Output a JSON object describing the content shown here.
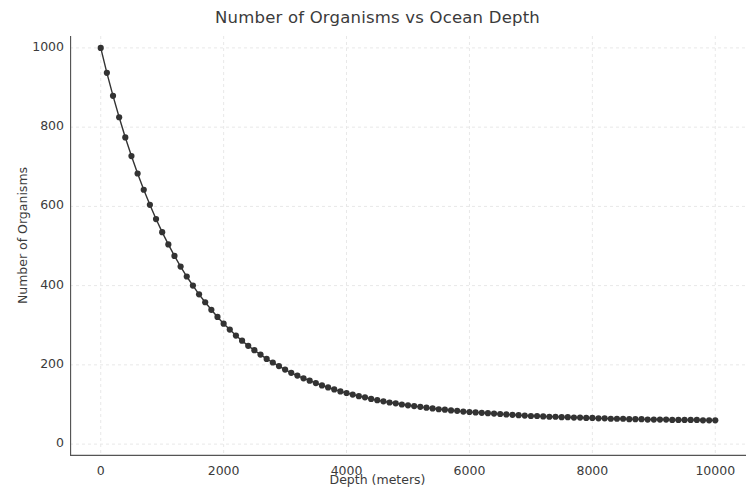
{
  "chart_data": {
    "type": "line",
    "title": "Number of Organisms vs Ocean Depth",
    "xlabel": "Depth (meters)",
    "ylabel": "Number of Organisms",
    "xlim": [
      -500,
      10500
    ],
    "ylim": [
      -30,
      1030
    ],
    "xticks": [
      0,
      2000,
      4000,
      6000,
      8000,
      10000
    ],
    "xtick_labels": [
      "0",
      "2000",
      "4000",
      "6000",
      "8000",
      "10000"
    ],
    "yticks": [
      0,
      200,
      400,
      600,
      800,
      1000
    ],
    "ytick_labels": [
      "0",
      "200",
      "400",
      "600",
      "800",
      "1000"
    ],
    "grid": true,
    "grid_style": "dashed",
    "grid_color": "#e8e8e8",
    "legend": null,
    "marker": "circle",
    "marker_color": "#333333",
    "line_color": "#333333",
    "series": [
      {
        "name": "Number of Organisms",
        "x": [
          0,
          100,
          200,
          300,
          400,
          500,
          600,
          700,
          800,
          900,
          1000,
          1100,
          1200,
          1300,
          1400,
          1500,
          1600,
          1700,
          1800,
          1900,
          2000,
          2100,
          2200,
          2300,
          2400,
          2500,
          2600,
          2700,
          2800,
          2900,
          3000,
          3100,
          3200,
          3300,
          3400,
          3500,
          3600,
          3700,
          3800,
          3900,
          4000,
          4100,
          4200,
          4300,
          4400,
          4500,
          4600,
          4700,
          4800,
          4900,
          5000,
          5100,
          5200,
          5300,
          5400,
          5500,
          5600,
          5700,
          5800,
          5900,
          6000,
          6100,
          6200,
          6300,
          6400,
          6500,
          6600,
          6700,
          6800,
          6900,
          7000,
          7100,
          7200,
          7300,
          7400,
          7500,
          7600,
          7700,
          7800,
          7900,
          8000,
          8100,
          8200,
          8300,
          8400,
          8500,
          8600,
          8700,
          8800,
          8900,
          9000,
          9100,
          9200,
          9300,
          9400,
          9500,
          9600,
          9700,
          9800,
          9900,
          10000
        ],
        "y": [
          1000,
          937,
          879,
          825,
          774,
          727,
          683,
          642,
          604,
          568,
          535,
          504,
          475,
          448,
          423,
          400,
          378,
          358,
          339,
          321,
          304,
          289,
          274,
          261,
          248,
          237,
          226,
          215,
          206,
          197,
          188,
          180,
          173,
          166,
          160,
          154,
          148,
          143,
          138,
          133,
          129,
          125,
          121,
          118,
          114,
          111,
          108,
          105,
          103,
          100,
          98,
          96,
          94,
          92,
          90,
          88,
          87,
          85,
          84,
          82,
          81,
          80,
          79,
          78,
          77,
          76,
          75,
          74,
          73,
          72,
          71,
          71,
          70,
          69,
          69,
          68,
          68,
          67,
          67,
          66,
          66,
          65,
          65,
          64,
          64,
          64,
          63,
          63,
          63,
          62,
          62,
          62,
          62,
          61,
          61,
          61,
          61,
          61,
          60,
          60,
          60
        ]
      }
    ]
  }
}
